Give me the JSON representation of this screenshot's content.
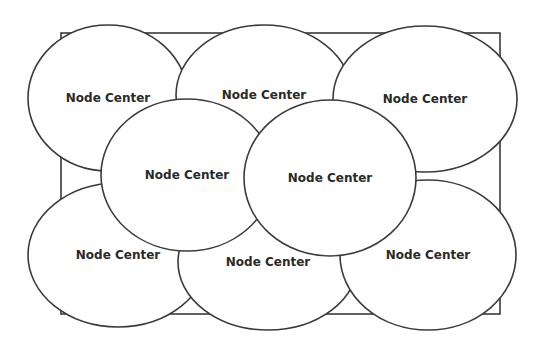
{
  "diagram": {
    "boundary": {
      "x": 61,
      "y": 33,
      "width": 439,
      "height": 281
    },
    "nodes": [
      {
        "label": "Node Center",
        "cx": 108,
        "cy": 98,
        "rx": 80,
        "ry": 73
      },
      {
        "label": "Node Center",
        "cx": 264,
        "cy": 95,
        "rx": 88,
        "ry": 70
      },
      {
        "label": "Node Center",
        "cx": 425,
        "cy": 99,
        "rx": 92,
        "ry": 73
      },
      {
        "label": "Node Center",
        "cx": 118,
        "cy": 255,
        "rx": 90,
        "ry": 72
      },
      {
        "label": "Node Center",
        "cx": 268,
        "cy": 262,
        "rx": 90,
        "ry": 68
      },
      {
        "label": "Node Center",
        "cx": 428,
        "cy": 255,
        "rx": 88,
        "ry": 75
      },
      {
        "label": "Node Center",
        "cx": 187,
        "cy": 175,
        "rx": 86,
        "ry": 76
      },
      {
        "label": "Node Center",
        "cx": 330,
        "cy": 178,
        "rx": 86,
        "ry": 78
      }
    ]
  }
}
